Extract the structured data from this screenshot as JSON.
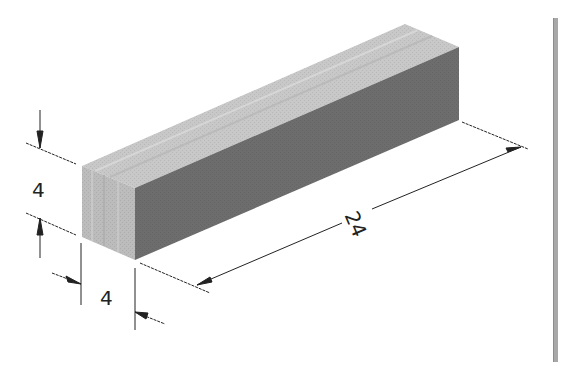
{
  "figure": {
    "type": "isometric-dimensioned-block",
    "colors": {
      "top_face": "#c9c9c9",
      "end_face": "#bdbdbd",
      "side_face": "#6e6e6e",
      "lines": "#222222",
      "side_bar": "#a8a8a8"
    }
  },
  "dimensions": {
    "height": {
      "label": "4"
    },
    "width": {
      "label": "4"
    },
    "length": {
      "label": "24"
    }
  }
}
